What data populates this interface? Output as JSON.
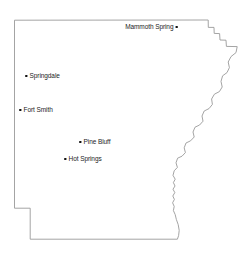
{
  "map": {
    "title": "Arkansas",
    "outline_color": "#9a9a9a",
    "fill_color": "#ffffff",
    "background_color": "#ffffff",
    "label_color": "#1c1c1c",
    "dot_color": "#111111",
    "width": 245,
    "height": 258
  },
  "cities": [
    {
      "name": "Mammoth Spring",
      "label_side": "left",
      "dot_x": 178,
      "dot_y": 27,
      "label_x": 174,
      "label_y": 23
    },
    {
      "name": "Springdale",
      "label_side": "right",
      "dot_x": 27,
      "dot_y": 76,
      "label_x": 25,
      "label_y": 72
    },
    {
      "name": "Fort Smith",
      "label_side": "right",
      "dot_x": 21,
      "dot_y": 110,
      "label_x": 19,
      "label_y": 106
    },
    {
      "name": "Pine Bluff",
      "label_side": "right",
      "dot_x": 81,
      "dot_y": 142,
      "label_x": 79,
      "label_y": 138
    },
    {
      "name": "Hot Springs",
      "label_side": "right",
      "dot_x": 66,
      "dot_y": 159,
      "label_x": 64,
      "label_y": 155
    }
  ]
}
